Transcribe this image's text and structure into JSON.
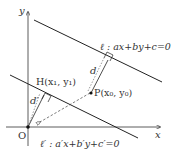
{
  "axes": {
    "x_label": "x",
    "y_label": "y",
    "origin_label": "O"
  },
  "line_l": {
    "label": "ℓ : ax+by+c=0"
  },
  "line_lp": {
    "label": "ℓ′ : a′x+b′y+c′=0"
  },
  "point_p": {
    "label": "P(x₀, y₀)"
  },
  "point_h": {
    "label": "H(x₁, y₁)"
  },
  "distances": {
    "d": "d",
    "d_prime": "d′"
  },
  "colors": {
    "stroke": "#222222"
  }
}
